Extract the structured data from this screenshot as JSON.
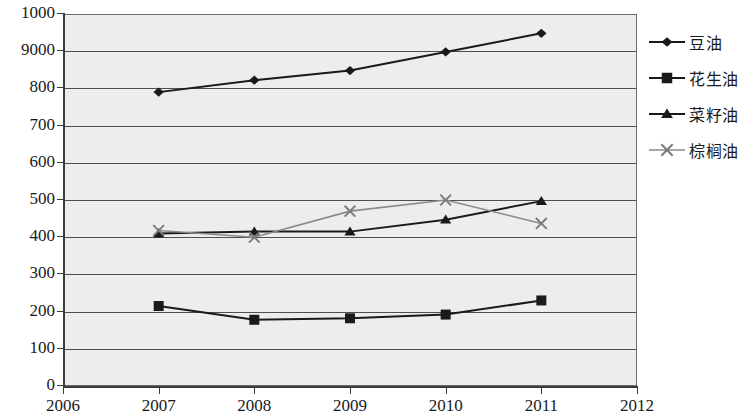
{
  "chart_data": {
    "type": "line",
    "title": "",
    "xlabel": "",
    "ylabel": "",
    "x": [
      2007,
      2008,
      2009,
      2010,
      2011
    ],
    "xlim": [
      2006,
      2012
    ],
    "ylim": [
      0,
      1000
    ],
    "x_tick_labels": [
      "2006",
      "2007",
      "2008",
      "2009",
      "2010",
      "2011",
      "2012"
    ],
    "y_tick_labels": [
      "0",
      "100",
      "200",
      "300",
      "400",
      "500",
      "600",
      "700",
      "800",
      "9000",
      "1000"
    ],
    "y_tick_values": [
      0,
      100,
      200,
      300,
      400,
      500,
      600,
      700,
      800,
      900,
      1000
    ],
    "grid": true,
    "grid_axis": "y",
    "legend_position": "right",
    "plot_background": "#ededed",
    "line_color": "#1a1a1a",
    "series": [
      {
        "name": "豆油",
        "marker": "diamond",
        "values": [
          790,
          822,
          848,
          898,
          948
        ]
      },
      {
        "name": "花生油",
        "marker": "square",
        "values": [
          215,
          178,
          182,
          192,
          230
        ]
      },
      {
        "name": "菜籽油",
        "marker": "triangle",
        "values": [
          410,
          415,
          415,
          447,
          497
        ]
      },
      {
        "name": "棕榈油",
        "marker": "cross",
        "values": [
          418,
          400,
          470,
          500,
          437
        ]
      }
    ]
  }
}
